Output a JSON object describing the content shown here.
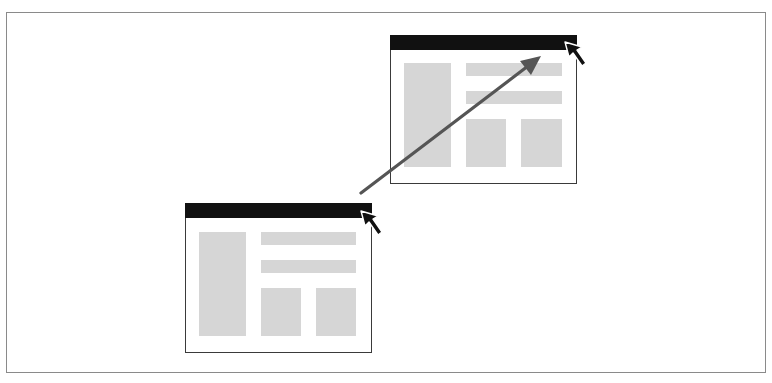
{
  "diagram": {
    "type": "window-drag-illustration",
    "colors": {
      "background": "#ffffff",
      "frame_border": "#8a8a8a",
      "window_border": "#3a3a3a",
      "title_bar": "#111111",
      "content_block": "#d6d6d6",
      "arrow": "#555555",
      "cursor_fill": "#111111",
      "cursor_outline": "#ffffff"
    },
    "windows": [
      {
        "role": "source",
        "position": "lower-left",
        "x": 185,
        "y": 203,
        "width": 187,
        "height": 150,
        "blocks": [
          {
            "kind": "sidebar",
            "x": 14,
            "y": 29,
            "w": 47,
            "h": 104
          },
          {
            "kind": "bar",
            "x": 76,
            "y": 29,
            "w": 95,
            "h": 13
          },
          {
            "kind": "bar",
            "x": 76,
            "y": 57,
            "w": 95,
            "h": 13
          },
          {
            "kind": "tile",
            "x": 76,
            "y": 85,
            "w": 40,
            "h": 48
          },
          {
            "kind": "tile",
            "x": 131,
            "y": 85,
            "w": 40,
            "h": 48
          }
        ],
        "cursor": {
          "tip_x": 361,
          "tip_y": 211
        }
      },
      {
        "role": "destination",
        "position": "upper-right",
        "x": 390,
        "y": 35,
        "width": 187,
        "height": 149,
        "blocks": [
          {
            "kind": "sidebar",
            "x": 14,
            "y": 28,
            "w": 47,
            "h": 104
          },
          {
            "kind": "bar",
            "x": 76,
            "y": 28,
            "w": 96,
            "h": 13
          },
          {
            "kind": "bar",
            "x": 76,
            "y": 56,
            "w": 96,
            "h": 13
          },
          {
            "kind": "tile",
            "x": 76,
            "y": 84,
            "w": 40,
            "h": 48
          },
          {
            "kind": "tile",
            "x": 131,
            "y": 84,
            "w": 41,
            "h": 48
          }
        ],
        "cursor": {
          "tip_x": 565,
          "tip_y": 42
        }
      }
    ],
    "arrow": {
      "from": {
        "x": 361,
        "y": 193
      },
      "to": {
        "x": 540,
        "y": 57
      },
      "meaning": "drag window by title bar"
    }
  }
}
